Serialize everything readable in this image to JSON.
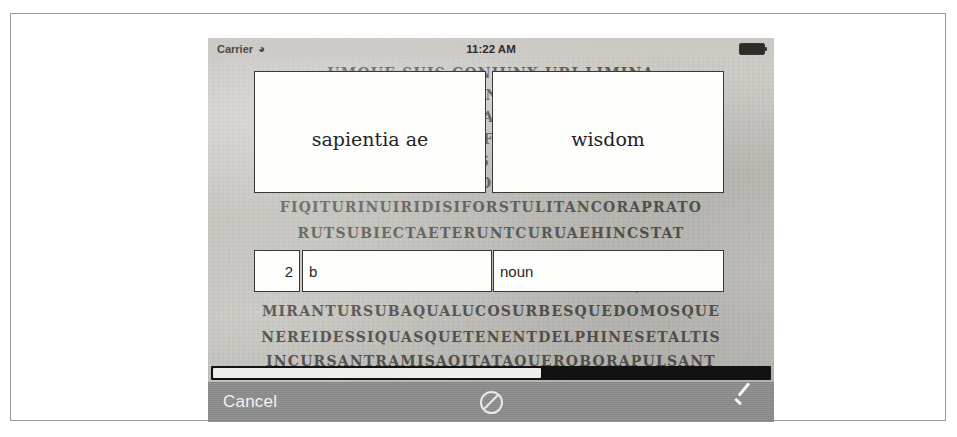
{
  "status_bar": {
    "carrier": "Carrier",
    "wifi_icon": "wifi-icon",
    "time": "11:22 AM",
    "battery_icon": "battery-icon"
  },
  "entry_form": {
    "headword": "sapientia ae",
    "meaning": "wisdom",
    "sense_number": "2",
    "subsense_letter": "b",
    "part_of_speech": "noun"
  },
  "toolbar": {
    "cancel_label": "Cancel",
    "block_icon": "no-entry-icon",
    "confirm_icon": "checkmark-icon"
  },
  "scrollbar": {
    "orientation": "horizontal",
    "thumb_percent": 59
  },
  "manuscript": {
    "lines": [
      "Umque suis coniunx ubi limina",
      "oo uae fuerant celso quae",
      "o quaeque sacris ignibus",
      "e nec non et fluminis altae",
      "li quas undis spumantibus",
      "N quae clamor pulsataque",
      "FIQITURINUIRIDISIFORSTULITANCORAPRATO",
      "RUTSUBIECTAETERUNTCURUAEHINCSTAT",
      "e quae uertice summo glomerat",
      "T dum litora seruant hinc atque",
      "MIRANTURSUBAQUALUCOSURBESQUEDOMOSQUE",
      "NEREIDESSIQUASQUETENENTDELPHINESETALTIS",
      "INCURSANTRAMISAQITATAQUEROBORAPULSANT"
    ]
  },
  "colors": {
    "toolbar_bg": "#8d8d8d",
    "field_border": "#3b3936",
    "field_bg": "#fdfdfc",
    "parchment": "#c6c4bf",
    "toolbar_text": "#f2f2f2"
  }
}
